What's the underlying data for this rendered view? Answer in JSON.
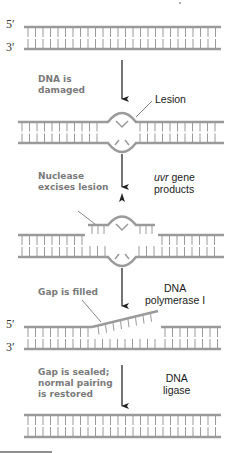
{
  "diagram": {
    "strand_ends": {
      "five_prime": "5′",
      "three_prime": "3′"
    },
    "colors": {
      "strand": "#9a9a9a",
      "rung": "#9a9a9a",
      "arrow": "#222222",
      "leader": "#666666",
      "step_label": "#7a7a7a",
      "enzyme_label": "#1a1a1a"
    },
    "steps": [
      {
        "id": "intact",
        "description": "Intact double-stranded DNA"
      },
      {
        "id": "damaged",
        "step_label_lines": [
          "DNA is",
          "damaged"
        ],
        "callout": "Lesion"
      },
      {
        "id": "excision",
        "step_label_lines": [
          "Nuclease",
          "excises lesion"
        ],
        "enzyme_italic": "uvr",
        "enzyme_rest_line1": " gene",
        "enzyme_line2": "products"
      },
      {
        "id": "fill",
        "step_label_lines": [
          "Gap is filled"
        ],
        "enzyme_lines": [
          "DNA",
          "polymerase I"
        ]
      },
      {
        "id": "seal",
        "step_label_lines": [
          "Gap is sealed;",
          "normal pairing",
          "is restored"
        ],
        "enzyme_lines": [
          "DNA",
          "ligase"
        ]
      }
    ]
  }
}
